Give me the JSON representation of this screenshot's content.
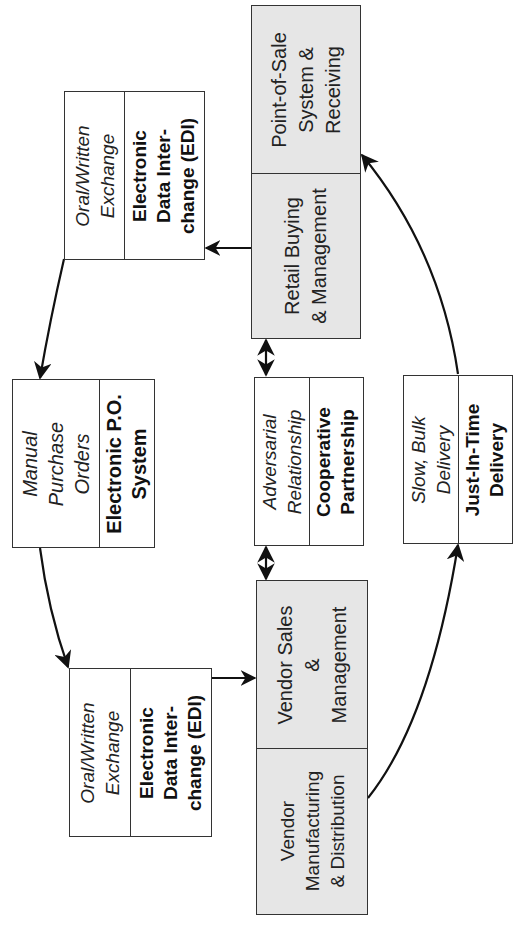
{
  "diagram": {
    "orientation": "rotated -90deg (text reads bottom-to-top)",
    "nodes": {
      "retail": {
        "top_label": "Point-of-Sale\nSystem &\nReceiving",
        "bottom_label": "Retail Buying\n& Management",
        "fill": "#e6e6e6"
      },
      "vendor": {
        "top_label": "Vendor Sales\n&\nManagement",
        "bottom_label": "Vendor\nManufacturing\n& Distribution",
        "fill": "#e6e6e6"
      },
      "exchange_top": {
        "old_label": "Oral/Written\nExchange",
        "new_label": "Electronic\nData Inter-\nchange (EDI)"
      },
      "purchase_orders": {
        "old_label": "Manual\nPurchase\nOrders",
        "new_label": "Electronic P.O.\nSystem"
      },
      "relationship": {
        "old_label": "Adversarial\nRelationship",
        "new_label": "Cooperative\nPartnership"
      },
      "delivery": {
        "old_label": "Slow, Bulk\nDelivery",
        "new_label": "Just-In-Time\nDelivery"
      },
      "exchange_bottom": {
        "old_label": "Oral/Written\nExchange",
        "new_label": "Electronic\nData Inter-\nchange (EDI)"
      }
    },
    "edges": [
      {
        "from": "retail",
        "to": "exchange_top",
        "type": "arrow"
      },
      {
        "from": "exchange_top",
        "to": "purchase_orders",
        "type": "curved-arrow"
      },
      {
        "from": "purchase_orders",
        "to": "exchange_bottom",
        "type": "curved-arrow"
      },
      {
        "from": "exchange_bottom",
        "to": "vendor",
        "type": "arrow"
      },
      {
        "from": "vendor",
        "to": "delivery",
        "type": "curved-arrow"
      },
      {
        "from": "delivery",
        "to": "retail",
        "type": "curved-arrow"
      },
      {
        "from": "retail",
        "to": "relationship",
        "type": "double-arrow"
      },
      {
        "from": "relationship",
        "to": "vendor",
        "type": "double-arrow"
      },
      {
        "from": "retail.point_of_sale",
        "to": "retail.buying",
        "type": "internal-arrow"
      },
      {
        "from": "vendor.sales",
        "to": "vendor.manufacturing",
        "type": "internal-arrow"
      }
    ],
    "colors": {
      "line": "#111111",
      "border": "#333333",
      "gray_fill": "#e6e6e6"
    }
  }
}
